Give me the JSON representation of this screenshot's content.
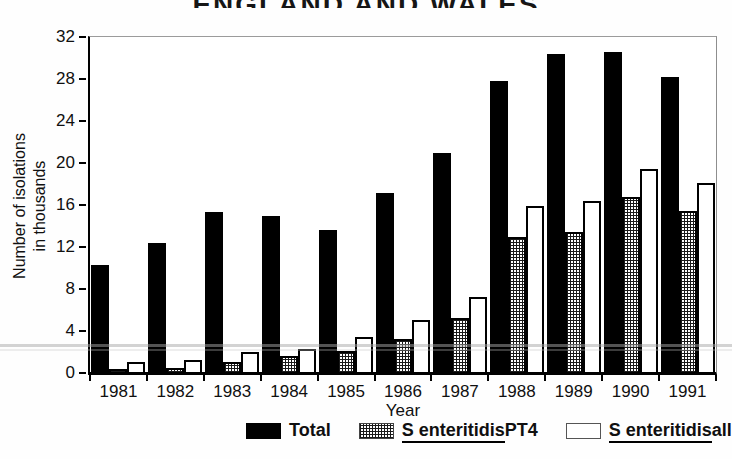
{
  "title": "ENGLAND AND WALES",
  "y_axis": {
    "title_line1": "Number of isolations",
    "title_line2": "in thousands"
  },
  "x_axis": {
    "title": "Year"
  },
  "colors": {
    "bar_fill": "#000000",
    "background": "#ffffff",
    "frame": "#8e8e8e",
    "axis": "#000000"
  },
  "chart_data": {
    "type": "bar",
    "title": "ENGLAND AND WALES",
    "xlabel": "Year",
    "ylabel": "Number of isolations in thousands",
    "ylim": [
      0,
      32
    ],
    "yticks": [
      0,
      4,
      8,
      12,
      16,
      20,
      24,
      28,
      32
    ],
    "grid": false,
    "legend_position": "bottom",
    "categories": [
      "1981",
      "1982",
      "1983",
      "1984",
      "1985",
      "1986",
      "1987",
      "1988",
      "1989",
      "1990",
      "1991"
    ],
    "series": [
      {
        "name": "Total",
        "style": "solid",
        "legend_underline": "",
        "legend_suffix": "Total",
        "values": [
          10.2,
          12.3,
          15.3,
          14.9,
          13.6,
          17.1,
          20.9,
          27.8,
          30.4,
          30.6,
          28.2
        ]
      },
      {
        "name": "S enteritidis PT4",
        "style": "hatch",
        "legend_underline": "S enteritidis",
        "legend_suffix": "PT4",
        "values": [
          0.3,
          0.4,
          1.0,
          1.5,
          2.0,
          3.2,
          5.2,
          12.9,
          13.4,
          16.7,
          15.4
        ]
      },
      {
        "name": "S enteritidis all",
        "style": "open",
        "legend_underline": "S enteritidis",
        "legend_suffix": "all",
        "values": [
          1.0,
          1.1,
          1.9,
          2.2,
          3.3,
          5.0,
          7.2,
          15.9,
          16.3,
          19.4,
          18.1
        ]
      }
    ]
  }
}
